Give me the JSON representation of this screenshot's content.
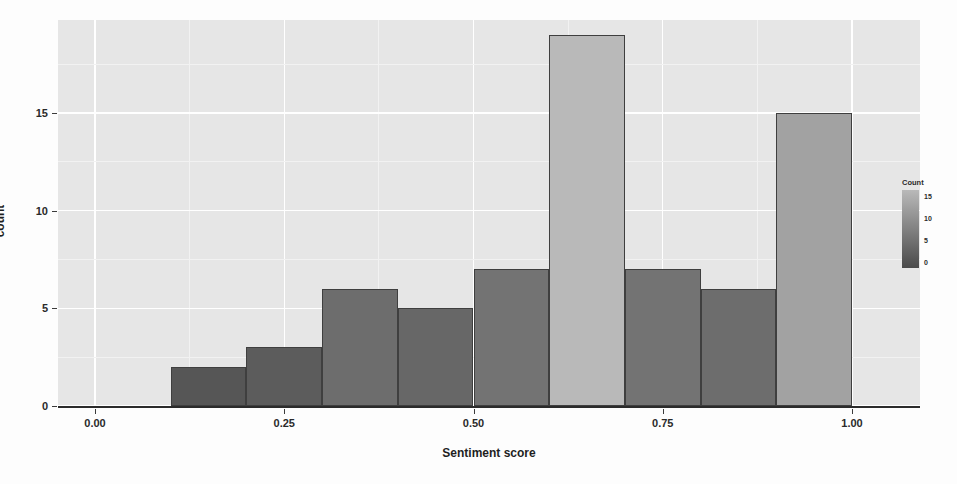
{
  "chart_data": {
    "type": "bar",
    "title": "",
    "xlabel": "Sentiment score",
    "ylabel": "count",
    "xlim": [
      0.0,
      1.05
    ],
    "ylim": [
      0,
      20
    ],
    "grid": true,
    "bin_width": 0.1,
    "bins": [
      {
        "x_start": 0.1,
        "x_end": 0.2,
        "center": 0.15,
        "value": 2
      },
      {
        "x_start": 0.2,
        "x_end": 0.3,
        "center": 0.25,
        "value": 3
      },
      {
        "x_start": 0.3,
        "x_end": 0.4,
        "center": 0.35,
        "value": 6
      },
      {
        "x_start": 0.4,
        "x_end": 0.5,
        "center": 0.45,
        "value": 5
      },
      {
        "x_start": 0.5,
        "x_end": 0.6,
        "center": 0.55,
        "value": 7
      },
      {
        "x_start": 0.6,
        "x_end": 0.7,
        "center": 0.65,
        "value": 19
      },
      {
        "x_start": 0.7,
        "x_end": 0.8,
        "center": 0.75,
        "value": 7
      },
      {
        "x_start": 0.8,
        "x_end": 0.9,
        "center": 0.85,
        "value": 6
      },
      {
        "x_start": 0.9,
        "x_end": 1.0,
        "center": 0.95,
        "value": 15
      }
    ],
    "categories": [
      "0.15",
      "0.25",
      "0.35",
      "0.45",
      "0.55",
      "0.65",
      "0.75",
      "0.85",
      "0.95"
    ],
    "values": [
      2,
      3,
      6,
      5,
      7,
      19,
      7,
      6,
      15
    ],
    "xticks": [
      {
        "value": 0.0,
        "label": "0.00"
      },
      {
        "value": 0.25,
        "label": "0.25"
      },
      {
        "value": 0.5,
        "label": "0.50"
      },
      {
        "value": 0.75,
        "label": "0.75"
      },
      {
        "value": 1.0,
        "label": "1.00"
      }
    ],
    "yticks": [
      {
        "value": 0,
        "label": "0"
      },
      {
        "value": 5,
        "label": "5"
      },
      {
        "value": 10,
        "label": "10"
      },
      {
        "value": 15,
        "label": "15"
      }
    ],
    "legend": {
      "title": "Count",
      "position": "right",
      "ticks": [
        {
          "value": 15,
          "label": "15"
        },
        {
          "value": 10,
          "label": "10"
        },
        {
          "value": 5,
          "label": "5"
        },
        {
          "value": 0,
          "label": "0"
        }
      ],
      "gradient_low_color": "#4a4a4a",
      "gradient_high_color": "#b9b9b9"
    },
    "colors": {
      "panel_background": "#e6e6e6",
      "gridline_major": "#ffffff",
      "gridline_minor": "#f2f2f2",
      "bar_low": "#4a4a4a",
      "bar_high": "#a9a9a9",
      "bar_outline": "#3f3f3f",
      "axis_line": "#2b2b2b",
      "text": "#1f1f1f"
    }
  }
}
